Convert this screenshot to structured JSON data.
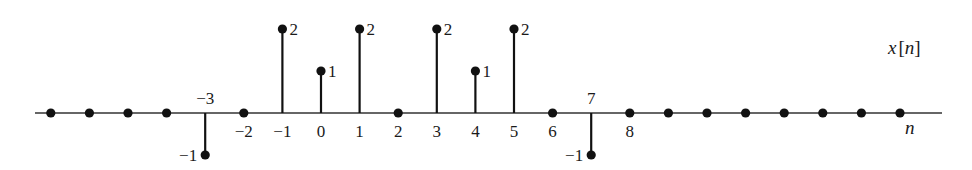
{
  "chart_data": {
    "type": "stem",
    "title": "x[n]",
    "xlabel": "n",
    "ylabel": "",
    "series": [
      {
        "name": "x[n]",
        "points": [
          {
            "n": -7,
            "value": 0
          },
          {
            "n": -6,
            "value": 0
          },
          {
            "n": -5,
            "value": 0
          },
          {
            "n": -4,
            "value": 0
          },
          {
            "n": -3,
            "value": -1
          },
          {
            "n": -2,
            "value": 0
          },
          {
            "n": -1,
            "value": 2
          },
          {
            "n": 0,
            "value": 1
          },
          {
            "n": 1,
            "value": 2
          },
          {
            "n": 2,
            "value": 0
          },
          {
            "n": 3,
            "value": 2
          },
          {
            "n": 4,
            "value": 1
          },
          {
            "n": 5,
            "value": 2
          },
          {
            "n": 6,
            "value": 0
          },
          {
            "n": 7,
            "value": -1
          },
          {
            "n": 8,
            "value": 0
          },
          {
            "n": 9,
            "value": 0
          },
          {
            "n": 10,
            "value": 0
          },
          {
            "n": 11,
            "value": 0
          },
          {
            "n": 12,
            "value": 0
          },
          {
            "n": 13,
            "value": 0
          },
          {
            "n": 14,
            "value": 0
          },
          {
            "n": 15,
            "value": 0
          }
        ]
      }
    ],
    "x_tick_labels": [
      {
        "n": -3,
        "label": "−3",
        "position": "above"
      },
      {
        "n": -2,
        "label": "−2",
        "position": "below"
      },
      {
        "n": -1,
        "label": "−1",
        "position": "below"
      },
      {
        "n": 0,
        "label": "0",
        "position": "below"
      },
      {
        "n": 1,
        "label": "1",
        "position": "below"
      },
      {
        "n": 2,
        "label": "2",
        "position": "below"
      },
      {
        "n": 3,
        "label": "3",
        "position": "below"
      },
      {
        "n": 4,
        "label": "4",
        "position": "below"
      },
      {
        "n": 5,
        "label": "5",
        "position": "below"
      },
      {
        "n": 6,
        "label": "6",
        "position": "below"
      },
      {
        "n": 7,
        "label": "7",
        "position": "above"
      },
      {
        "n": 8,
        "label": "8",
        "position": "below"
      }
    ],
    "value_labels": [
      {
        "n": -3,
        "label": "−1"
      },
      {
        "n": -1,
        "label": "2"
      },
      {
        "n": 0,
        "label": "1"
      },
      {
        "n": 1,
        "label": "2"
      },
      {
        "n": 3,
        "label": "2"
      },
      {
        "n": 4,
        "label": "1"
      },
      {
        "n": 5,
        "label": "2"
      },
      {
        "n": 7,
        "label": "−1"
      }
    ],
    "xlim": [
      -8,
      16
    ],
    "ylim": [
      -1,
      2
    ],
    "grid": false,
    "legend": null
  },
  "labels": {
    "signal_name_x": "x",
    "signal_name_open": "[",
    "signal_name_n": "n",
    "signal_name_close": "]",
    "axis_var": "n"
  }
}
